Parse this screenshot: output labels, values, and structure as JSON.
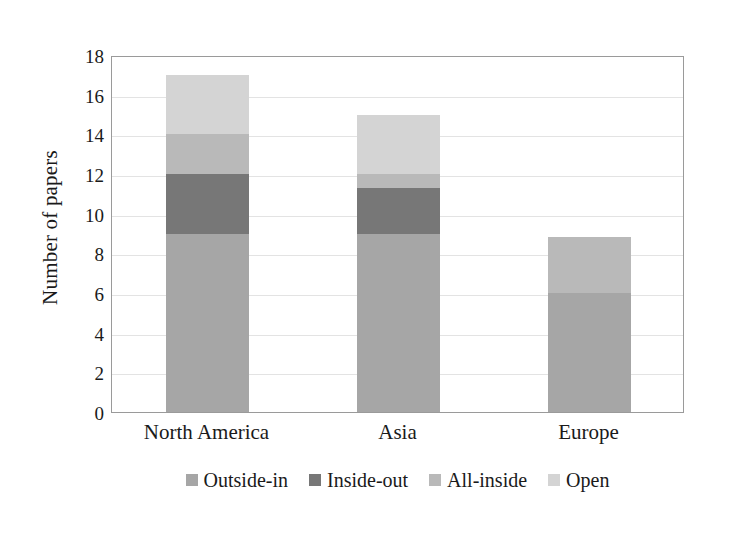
{
  "chart_data": {
    "type": "bar",
    "subtype": "stacked-bar",
    "title": "",
    "xlabel": "",
    "ylabel": "Number of papers",
    "categories": [
      "North America",
      "Asia",
      "Europe"
    ],
    "series": [
      {
        "name": "Outside-in",
        "color": "#a6a6a6",
        "values": [
          9,
          9,
          6
        ]
      },
      {
        "name": "Inside-out",
        "color": "#777777",
        "values": [
          3,
          2.3,
          0
        ]
      },
      {
        "name": "All-inside",
        "color": "#b9b9b9",
        "values": [
          2,
          0.7,
          2.8
        ]
      },
      {
        "name": "Open",
        "color": "#d4d4d4",
        "values": [
          3,
          3,
          0
        ]
      }
    ],
    "totals": [
      17,
      15,
      8.8
    ],
    "ylim": [
      0,
      18
    ],
    "ytick_step": 2,
    "ytick_labels": [
      "18",
      "16",
      "14",
      "12",
      "10",
      "8",
      "6",
      "4",
      "2",
      "0"
    ],
    "ytick_values": [
      18,
      16,
      14,
      12,
      10,
      8,
      6,
      4,
      2,
      0
    ],
    "grid": "horizontal",
    "legend_position": "bottom"
  },
  "legend": {
    "items": [
      {
        "label": "Outside-in",
        "color": "#a6a6a6"
      },
      {
        "label": "Inside-out",
        "color": "#777777"
      },
      {
        "label": "All-inside",
        "color": "#b9b9b9"
      },
      {
        "label": "Open",
        "color": "#d4d4d4"
      }
    ]
  },
  "axes": {
    "y_title": "Number of papers"
  },
  "colors": {
    "plot_border": "#9a9a9a",
    "gridline": "#e3e3e3",
    "background": "#ffffff",
    "text": "#1a1a1a"
  }
}
